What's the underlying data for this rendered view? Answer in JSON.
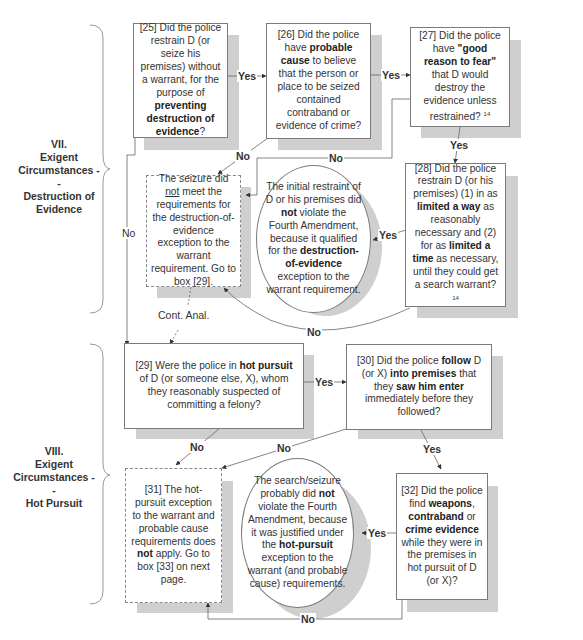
{
  "sections": [
    {
      "id": "VII",
      "label_lines": [
        "VII.",
        "Exigent",
        "Circumstances --",
        "Destruction of",
        "Evidence"
      ]
    },
    {
      "id": "VIII",
      "label_lines": [
        "VIII.",
        "Exigent",
        "Circumstances --",
        "Hot Pursuit"
      ]
    }
  ],
  "nodes": {
    "b25": {
      "num": "[25]",
      "pre": "Did the police restrain D (or seize his premises) without a warrant, for the purpose of ",
      "bold": "preventing destruction of evidence",
      "post": "?"
    },
    "b26": {
      "num": "[26]",
      "pre": "Did the police have ",
      "bold": "probable cause",
      "post": " to believe that the person or place to be seized contained contraband or evidence of crime?"
    },
    "b27": {
      "num": "[27]",
      "pre": "Did the police have ",
      "bold": "\"good reason to fear\"",
      "post": " that D would destroy the evidence unless restrained?",
      "footnote": "14"
    },
    "b28": {
      "num": "[28]",
      "pre": "Did the police restrain D (or his premises) (1) in as ",
      "bold1": "limited a way",
      "mid": " as reasonably necessary and (2) for as ",
      "bold2": "limited a time",
      "post": " as necessary, until they could get a search warrant?",
      "footnote": "14"
    },
    "fail_destruction": {
      "pre": "The seizure did ",
      "underline": "not",
      "post": " meet the requirements for the destruction-of-evidence exception to the warrant requirement. Go to box [29]."
    },
    "ok_destruction": {
      "pre": "The initial restraint of D or his premises did ",
      "bold1": "not",
      "mid": " violate the Fourth Amendment, because it qualified for the ",
      "bold2": "destruction-of-evidence",
      "post": " exception to the warrant requirement."
    },
    "b29": {
      "num": "[29]",
      "pre": "Were the police in ",
      "bold": "hot pursuit",
      "post": " of D (or someone else, X), whom they reasonably suspected of committing a felony?"
    },
    "b30": {
      "num": "[30]",
      "pre": "Did the police ",
      "bold1": "follow",
      "mid1": " D (or X) ",
      "bold2": "into premises",
      "mid2": " that they ",
      "bold3": "saw him enter",
      "post": " immediately before they followed?"
    },
    "b31": {
      "num": "[31]",
      "pre": "The hot-pursuit exception to the warrant and probable cause requirements does ",
      "bold": "not",
      "post": " apply. Go to box [33] on next page."
    },
    "ok_hotpursuit": {
      "pre": "The search/seizure probably did ",
      "bold1": "not",
      "mid": " violate the Fourth Amendment, because it was justified under the ",
      "bold2": "hot-pursuit",
      "post": " exception to the warrant (and probable cause) requirements."
    },
    "b32": {
      "num": "[32]",
      "pre": "Did the police find ",
      "bold1": "weapons",
      "mid1": ", ",
      "bold2": "contraband",
      "mid2": " or ",
      "bold3": "crime evidence",
      "post": " while they were in the premises in hot pursuit of D (or X)?"
    }
  },
  "edge_labels": {
    "b25_yes": "Yes",
    "b26_yes": "Yes",
    "b26_no": "No",
    "b27_yes": "Yes",
    "b27_no": "No",
    "b28_yes": "Yes",
    "b28_no": "No",
    "b25_no": "No",
    "cont_anal": "Cont. Anal.",
    "b29_yes": "Yes",
    "b29_no": "No",
    "b30_no": "No",
    "b30_yes": "Yes",
    "b32_yes": "Yes",
    "b32_no": "No"
  },
  "colors": {
    "border": "#7a7a7a",
    "shadow": "#cfcfcf",
    "line": "#666666",
    "text": "#333333"
  }
}
